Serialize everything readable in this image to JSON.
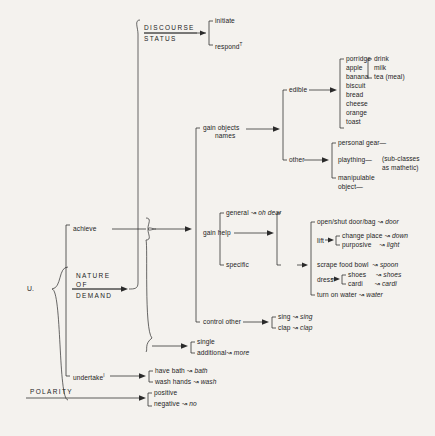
{
  "diagram": {
    "entry_point": "U.",
    "background_color": "#f4f2ee",
    "ink_color": "#2a2a2a",
    "systems": [
      {
        "name": "DISCOURSE\nSTATUS",
        "line1": "DISCOURSE",
        "line2": "STATUS"
      },
      {
        "name": "NATURE OF DEMAND",
        "line1": "NATURE",
        "line2": "OF",
        "line3": "DEMAND"
      },
      {
        "name": "POLARITY",
        "line1": "POLARITY"
      }
    ],
    "discourse_status": {
      "options": [
        {
          "label": "initiate",
          "superscript": ""
        },
        {
          "label": "respond",
          "superscript": "T"
        }
      ]
    },
    "nature_of_demand": {
      "options": [
        {
          "label": "achieve",
          "superscript": ""
        },
        {
          "label": "undertake",
          "superscript": "I"
        }
      ]
    },
    "achieve": {
      "options": [
        {
          "label": "gain objects",
          "label2": "names"
        },
        {
          "label": "gain help"
        },
        {
          "label": "control other"
        }
      ],
      "number": [
        {
          "label": "single",
          "realization": ""
        },
        {
          "label": "additional",
          "realization": "more"
        }
      ]
    },
    "gain_objects_names": {
      "options": [
        {
          "label": "edible"
        },
        {
          "label": "other"
        }
      ],
      "edible_items": [
        "porridge",
        "apple",
        "banana",
        "biscuit",
        "bread",
        "cheese",
        "orange",
        "toast"
      ],
      "edible_subset": [
        "drink",
        "milk",
        "tea (meal)"
      ],
      "other_items": [
        {
          "label": "personal gear—"
        },
        {
          "label": "plaything—"
        },
        {
          "label": "manipulable",
          "label2": "object—"
        }
      ],
      "other_note": {
        "line1": "(sub-classes",
        "line2": "as mathetic)"
      }
    },
    "gain_help": {
      "options": [
        {
          "label": "general",
          "realization": "oh dear"
        },
        {
          "label": "specific",
          "realization": ""
        }
      ],
      "specific_items": [
        {
          "label": "open/shut door/bag",
          "realization": "door"
        },
        {
          "label": "lift",
          "sub": [
            {
              "label": "change place",
              "realization": "down"
            },
            {
              "label": "purposive",
              "realization": "light"
            }
          ]
        },
        {
          "label": "scrape food bowl",
          "realization": "spoon"
        },
        {
          "label": "dress",
          "sub": [
            {
              "label": "shoes",
              "realization": "shoes"
            },
            {
              "label": "cardi",
              "realization": "cardi"
            }
          ]
        },
        {
          "label": "turn on water",
          "realization": "water"
        }
      ]
    },
    "control_other": {
      "options": [
        {
          "label": "sing",
          "realization": "sing"
        },
        {
          "label": "clap",
          "realization": "clap"
        }
      ]
    },
    "undertake": {
      "options": [
        {
          "label": "have bath",
          "realization": "bath"
        },
        {
          "label": "wash hands",
          "realization": "wash"
        }
      ]
    },
    "polarity": {
      "options": [
        {
          "label": "positive",
          "realization": ""
        },
        {
          "label": "negative",
          "realization": "no"
        }
      ]
    },
    "realization_arrow": "↝"
  }
}
